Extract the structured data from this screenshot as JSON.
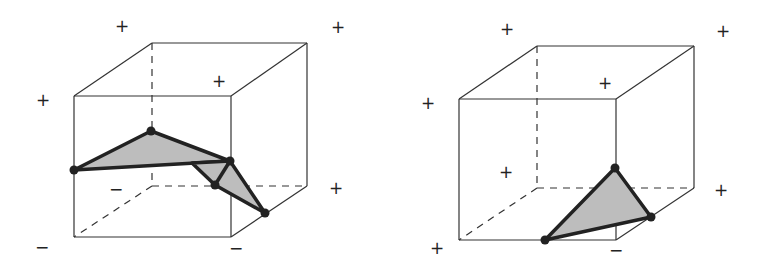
{
  "figure": {
    "colors": {
      "edge": "#333333",
      "surface_fill": "#bdbdbd",
      "surface_stroke": "#222222",
      "vertex": "#222222",
      "background": "#ffffff"
    }
  },
  "cubes": [
    {
      "id": "left",
      "front": [
        [
          74,
          96
        ],
        [
          231,
          96
        ],
        [
          231,
          237
        ],
        [
          74,
          237
        ]
      ],
      "back": [
        [
          152,
          43
        ],
        [
          307,
          43
        ],
        [
          307,
          186
        ],
        [
          152,
          186
        ]
      ],
      "signs": [
        {
          "label": "+",
          "x": 122,
          "y": 26
        },
        {
          "label": "+",
          "x": 338,
          "y": 27
        },
        {
          "label": "+",
          "x": 219,
          "y": 81
        },
        {
          "label": "+",
          "x": 43,
          "y": 100
        },
        {
          "label": "+",
          "x": 336,
          "y": 188
        },
        {
          "label": "−",
          "x": 116,
          "y": 189
        },
        {
          "label": "−",
          "x": 42,
          "y": 247
        },
        {
          "label": "−",
          "x": 236,
          "y": 248
        }
      ],
      "polygons": [
        [
          [
            74,
            170
          ],
          [
            151,
            131
          ],
          [
            230,
            161
          ]
        ],
        [
          [
            192,
            163
          ],
          [
            230,
            161
          ],
          [
            265,
            213
          ],
          [
            215,
            185
          ]
        ]
      ],
      "extra_edges": [
        [
          [
            230,
            161
          ],
          [
            215,
            185
          ]
        ]
      ],
      "vertices": [
        [
          74,
          170
        ],
        [
          151,
          131
        ],
        [
          230,
          161
        ],
        [
          215,
          185
        ],
        [
          265,
          213
        ]
      ]
    },
    {
      "id": "right",
      "front": [
        [
          459,
          99
        ],
        [
          616,
          99
        ],
        [
          616,
          240
        ],
        [
          459,
          240
        ]
      ],
      "back": [
        [
          537,
          46
        ],
        [
          694,
          46
        ],
        [
          694,
          188
        ],
        [
          537,
          188
        ]
      ],
      "signs": [
        {
          "label": "+",
          "x": 507,
          "y": 29
        },
        {
          "label": "+",
          "x": 723,
          "y": 31
        },
        {
          "label": "+",
          "x": 605,
          "y": 83
        },
        {
          "label": "+",
          "x": 428,
          "y": 103
        },
        {
          "label": "+",
          "x": 506,
          "y": 172
        },
        {
          "label": "+",
          "x": 721,
          "y": 190
        },
        {
          "label": "+",
          "x": 437,
          "y": 248
        },
        {
          "label": "−",
          "x": 616,
          "y": 250
        }
      ],
      "polygons": [
        [
          [
            615,
            168
          ],
          [
            651,
            217
          ],
          [
            545,
            240
          ]
        ]
      ],
      "extra_edges": [],
      "vertices": [
        [
          615,
          168
        ],
        [
          651,
          217
        ],
        [
          545,
          240
        ]
      ]
    }
  ]
}
